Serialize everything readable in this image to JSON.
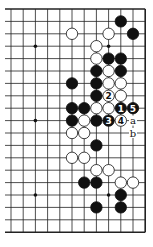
{
  "board": {
    "origin_x": 11,
    "origin_y": 9,
    "spacing_x": 12.2,
    "spacing_y": 12.4,
    "cols": 12,
    "rows": 19,
    "left_open": true,
    "line_color": "#222222",
    "hoshi": [
      [
        2,
        3
      ],
      [
        8,
        3
      ],
      [
        2,
        9
      ],
      [
        2,
        15
      ],
      [
        8,
        15
      ]
    ],
    "stones": [
      {
        "c": 9,
        "r": 1,
        "color": "black"
      },
      {
        "c": 5,
        "r": 2,
        "color": "white"
      },
      {
        "c": 8,
        "r": 2,
        "color": "white"
      },
      {
        "c": 10,
        "r": 2,
        "color": "black"
      },
      {
        "c": 7,
        "r": 3,
        "color": "white"
      },
      {
        "c": 7,
        "r": 4,
        "color": "white"
      },
      {
        "c": 8,
        "r": 4,
        "color": "black"
      },
      {
        "c": 9,
        "r": 4,
        "color": "black"
      },
      {
        "c": 7,
        "r": 5,
        "color": "black"
      },
      {
        "c": 8,
        "r": 5,
        "color": "white"
      },
      {
        "c": 9,
        "r": 5,
        "color": "black"
      },
      {
        "c": 5,
        "r": 6,
        "color": "black"
      },
      {
        "c": 7,
        "r": 6,
        "color": "black"
      },
      {
        "c": 8,
        "r": 6,
        "color": "white"
      },
      {
        "c": 9,
        "r": 6,
        "color": "white"
      },
      {
        "c": 7,
        "r": 7,
        "color": "black"
      },
      {
        "c": 8,
        "r": 7,
        "color": "white",
        "label": "2"
      },
      {
        "c": 9,
        "r": 7,
        "color": "white"
      },
      {
        "c": 5,
        "r": 8,
        "color": "black"
      },
      {
        "c": 6,
        "r": 8,
        "color": "black"
      },
      {
        "c": 7,
        "r": 8,
        "color": "white"
      },
      {
        "c": 8,
        "r": 8,
        "color": "white"
      },
      {
        "c": 9,
        "r": 8,
        "color": "black",
        "label": "1"
      },
      {
        "c": 10,
        "r": 8,
        "color": "black",
        "label": "5"
      },
      {
        "c": 5,
        "r": 9,
        "color": "black"
      },
      {
        "c": 6,
        "r": 9,
        "color": "white"
      },
      {
        "c": 7,
        "r": 9,
        "color": "black"
      },
      {
        "c": 8,
        "r": 9,
        "color": "black",
        "label": "3"
      },
      {
        "c": 9,
        "r": 9,
        "color": "white",
        "label": "4"
      },
      {
        "c": 5,
        "r": 10,
        "color": "white"
      },
      {
        "c": 6,
        "r": 10,
        "color": "white"
      },
      {
        "c": 7,
        "r": 11,
        "color": "black"
      },
      {
        "c": 5,
        "r": 12,
        "color": "white"
      },
      {
        "c": 6,
        "r": 12,
        "color": "white"
      },
      {
        "c": 7,
        "r": 13,
        "color": "white"
      },
      {
        "c": 8,
        "r": 13,
        "color": "white"
      },
      {
        "c": 6,
        "r": 14,
        "color": "black"
      },
      {
        "c": 7,
        "r": 14,
        "color": "black"
      },
      {
        "c": 9,
        "r": 14,
        "color": "white"
      },
      {
        "c": 10,
        "r": 14,
        "color": "white"
      },
      {
        "c": 9,
        "r": 15,
        "color": "black"
      },
      {
        "c": 7,
        "r": 16,
        "color": "black"
      },
      {
        "c": 9,
        "r": 16,
        "color": "black"
      }
    ],
    "markers": [
      {
        "c": 10,
        "r": 9,
        "label": "a"
      },
      {
        "c": 10,
        "r": 10,
        "label": "b"
      }
    ]
  }
}
